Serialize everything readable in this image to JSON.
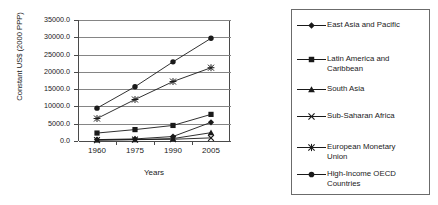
{
  "chart_data": {
    "type": "line",
    "title": "",
    "xlabel": "Years",
    "ylabel": "Constant US$ (2000 PPP)",
    "x": [
      1960,
      1975,
      1990,
      2005
    ],
    "xtick_labels": [
      "1960",
      "1975",
      "1990",
      "2005"
    ],
    "ytick_labels": [
      "0.0",
      "5000.0",
      "10000.0",
      "15000.0",
      "20000.0",
      "25000.0",
      "30000.0",
      "35000.0"
    ],
    "ytick_values": [
      0,
      5000,
      10000,
      15000,
      20000,
      25000,
      30000,
      35000
    ],
    "ylim": [
      0,
      35000
    ],
    "grid": "horizontal",
    "legend_position": "right",
    "series": [
      {
        "name": "East Asia and Pacific",
        "marker": "diamond",
        "values": [
          400,
          600,
          1300,
          5400
        ]
      },
      {
        "name": "Latin America and Caribbean",
        "marker": "square",
        "values": [
          2300,
          3300,
          4500,
          7700
        ]
      },
      {
        "name": "South Asia",
        "marker": "triangle",
        "values": [
          300,
          400,
          700,
          2400
        ]
      },
      {
        "name": "Sub-Saharan Africa",
        "marker": "x",
        "values": [
          250,
          400,
          500,
          900
        ]
      },
      {
        "name": "European Monetary Union",
        "marker": "asterisk",
        "values": [
          6500,
          12000,
          17200,
          21200
        ]
      },
      {
        "name": "High-Income OECD Countries",
        "marker": "circle",
        "values": [
          9500,
          15700,
          22900,
          29700
        ]
      }
    ]
  },
  "legend": {
    "entries": [
      {
        "label": "East Asia and Pacific",
        "marker": "diamond"
      },
      {
        "label": "Latin America and\nCaribbean",
        "marker": "square"
      },
      {
        "label": "South Asia",
        "marker": "triangle"
      },
      {
        "label": "Sub-Saharan Africa",
        "marker": "x"
      },
      {
        "label": "European Monetary\nUnion",
        "marker": "asterisk"
      },
      {
        "label": "High-Income OECD\nCountries",
        "marker": "circle"
      }
    ]
  },
  "colors": {
    "series_line": "#1a1a1a",
    "gridline": "#858585",
    "axis": "#4a4a4a",
    "background": "#ffffff"
  }
}
